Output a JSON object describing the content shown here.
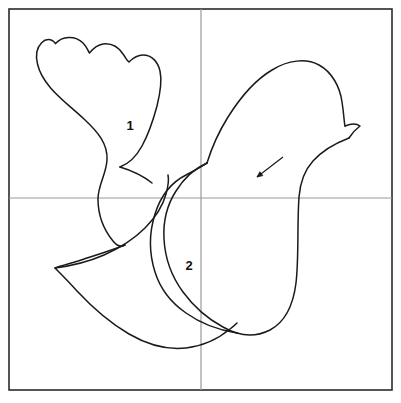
{
  "figure": {
    "background_color": "#ffffff",
    "frame": {
      "name": "outer-frame",
      "color": "#2b2b2b",
      "x": 9,
      "y": 9,
      "width": 383,
      "height": 381,
      "stroke_width": 1.6
    },
    "guides": {
      "color": "#9a9a9a",
      "stroke_width": 1.2,
      "vertical_x": 201,
      "horizontal_y": 198
    },
    "outline": {
      "color": "#1a1a1a",
      "stroke_width": 1.5,
      "fill": "none"
    },
    "labels": [
      {
        "id": "label-1",
        "text": "1",
        "x": 130,
        "y": 130,
        "describes": "wing"
      },
      {
        "id": "label-2",
        "text": "2",
        "x": 189,
        "y": 270,
        "describes": "body"
      }
    ],
    "annotation_arrow": {
      "name": "pointer-arrow",
      "color": "#1a1a1a",
      "stroke_width": 1.2,
      "from_x": 283,
      "from_y": 157,
      "to_x": 257,
      "to_y": 177,
      "head_size": 6
    },
    "paths": {
      "wing": "M 55.5 43.5 C 47 33 33 45 37.5 64 C 42.5 86 64.5 101 84 119 C 98 132 108 144 107 160 C 106 175 98 185 98 199 C 98 216 104 230 113 241 C 118 247 122 247 125 245",
      "wing_top": "M 55.5 43.5 C 62 36 75 35 83 43 C 87 47 88 51 89.5 53 C 92 50 96 45 103 44 C 112 43 119 48 123 54 C 126 58 127 61 129 62 C 132 59 137 55 143 55 C 152 55 158 62 160 71 C 162 80 160 94 157 106 C 153 121 148 135 142 146 C 136 157 128 164 120 167",
      "wing_right_tail": "M 120 167 C 130 170 142 175 152 183",
      "head_back": "M 207 163 C 211 150 218 133 228 117 C 240 98 255 80 272 70 C 288 60 306 58 319 65 C 332 72 340 87 342 102 C 344 114 344 122 345 126",
      "beak": "M 345 126 C 350 124 356 123 360 126 C 356 129 352 133 349 138",
      "back_down": "M 349 138 C 336 143 322 151 313 161 C 303 172 300 184 299 197 C 297 225 299 258 296 283 C 293 307 285 322 270 330 C 258 336 246 336 237 333",
      "belly": "M 237 333 C 218 330 200 323 186 313 C 170 302 160 288 155 272 C 149 253 149 233 155 214 C 161 195 172 182 186 175 C 196 170 202 166 207 163",
      "chest_inner": "M 207 163 C 196 168 184 178 176 191 C 167 205 163 222 164 239 C 165 258 172 277 183 292 C 194 307 208 319 223 327 C 228 330 233 332 237 333",
      "tail": "M 125 245 C 110 251 93 256 78 261 C 68 264 60 266 55 268 C 60 273 68 281 77 291 C 92 307 110 323 129 334 C 148 345 168 350 186 348 C 203 346 218 339 230 329 C 234 326 236 324 237 323",
      "tail_upper": "M 55 268 C 70 266 88 262 104 255 C 120 248 134 239 145 228 C 156 217 163 205 166 194 C 168 187 169 180 168 175"
    }
  }
}
